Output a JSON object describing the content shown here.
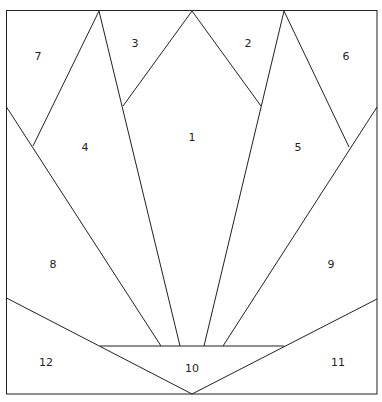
{
  "diagram": {
    "type": "quilt-paper-piecing-pattern",
    "stroke_color": "#231f20",
    "background": "#ffffff",
    "labels": [
      {
        "text": "1",
        "x": 192,
        "y": 137
      },
      {
        "text": "2",
        "x": 248,
        "y": 43
      },
      {
        "text": "3",
        "x": 135,
        "y": 43
      },
      {
        "text": "4",
        "x": 85,
        "y": 147
      },
      {
        "text": "5",
        "x": 298,
        "y": 147
      },
      {
        "text": "6",
        "x": 346,
        "y": 56
      },
      {
        "text": "7",
        "x": 38,
        "y": 56
      },
      {
        "text": "8",
        "x": 53,
        "y": 264
      },
      {
        "text": "9",
        "x": 331,
        "y": 264
      },
      {
        "text": "10",
        "x": 192,
        "y": 368
      },
      {
        "text": "11",
        "x": 338,
        "y": 362
      },
      {
        "text": "12",
        "x": 46,
        "y": 362
      }
    ]
  }
}
